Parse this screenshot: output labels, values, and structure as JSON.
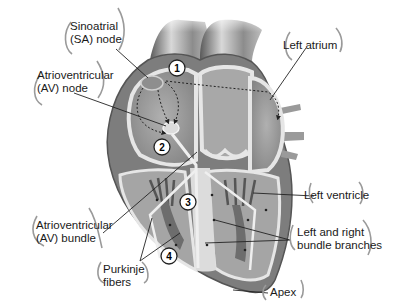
{
  "colors": {
    "background": "#ffffff",
    "heart_wall": "#8a8a8a",
    "heart_dark": "#5e5e5e",
    "chamber": "#9c9c9c",
    "septum_light": "#e4e4e4",
    "text": "#1a1a1a",
    "bracket": "#9a9a9a",
    "leader_line": "#222222"
  },
  "labels": {
    "sa_node": {
      "line1": "Sinoatrial",
      "line2": "(SA) node"
    },
    "av_node": {
      "line1": "Atrioventricular",
      "line2": "(AV) node"
    },
    "left_atrium": {
      "line1": "Left atrium"
    },
    "av_bundle": {
      "line1": "Atrioventricular",
      "line2": "(AV) bundle"
    },
    "left_ventricle": {
      "line1": "Left ventricle"
    },
    "bundle_branches": {
      "line1": "Left and right",
      "line2": "bundle branches"
    },
    "purkinje": {
      "line1": "Purkinje",
      "line2": "fibers"
    },
    "apex": {
      "line1": "Apex"
    }
  },
  "markers": [
    {
      "id": "1",
      "label": "1"
    },
    {
      "id": "2",
      "label": "2"
    },
    {
      "id": "3",
      "label": "3"
    },
    {
      "id": "4",
      "label": "4"
    }
  ]
}
